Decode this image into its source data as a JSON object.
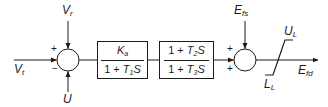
{
  "diagram": {
    "type": "control-block-diagram",
    "colors": {
      "line": "#1a1a1a",
      "background": "#ffffff"
    },
    "inputs": {
      "vt": {
        "symbol": "V",
        "subscript": "t"
      },
      "vr": {
        "symbol": "V",
        "subscript": "r"
      },
      "u": {
        "symbol": "U",
        "subscript": ""
      },
      "efs": {
        "symbol": "E",
        "subscript": "fs"
      }
    },
    "output": {
      "symbol": "E",
      "subscript": "fd"
    },
    "summing_junction_1": {
      "signs": {
        "left": "+",
        "bottom_left": "−"
      }
    },
    "summing_junction_2": {
      "signs": {
        "top_left": "+",
        "bottom_left": "+"
      }
    },
    "block_1": {
      "numerator": {
        "symbol": "K",
        "subscript": "a"
      },
      "denominator": {
        "prefix": "1 + ",
        "symbol": "T",
        "subscript": "1",
        "suffix": "S"
      }
    },
    "block_2": {
      "numerator": {
        "prefix": "1 + ",
        "symbol": "T",
        "subscript": "2",
        "suffix": "S"
      },
      "denominator": {
        "prefix": "1 + ",
        "symbol": "T",
        "subscript": "3",
        "suffix": "S"
      }
    },
    "limiter": {
      "upper": {
        "symbol": "U",
        "subscript": "L"
      },
      "lower": {
        "symbol": "L",
        "subscript": "L"
      }
    }
  }
}
